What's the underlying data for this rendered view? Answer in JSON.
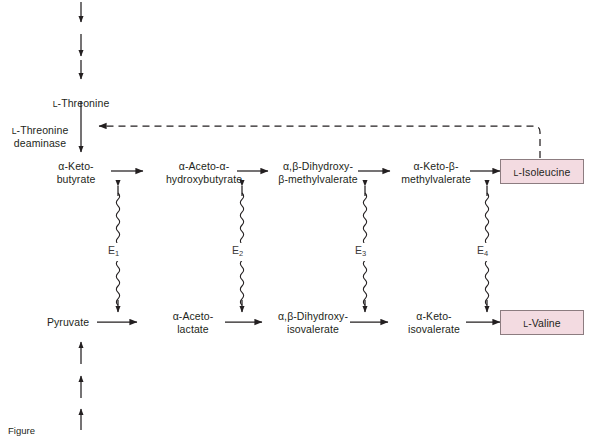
{
  "diagram": {
    "colors": {
      "product_box_fill": "#f3dbe1",
      "product_box_border": "#8c7c80",
      "text": "#231f20",
      "arrow": "#231f20"
    },
    "upstream_chain": {
      "arrow_count": 3,
      "terminal_label": "L-Threonine"
    },
    "enzyme_step": {
      "label": "L-Threonine\ndeaminase"
    },
    "top_row": [
      {
        "name": "alpha-ketobutyrate",
        "label": "α-Keto-\nbutyrate"
      },
      {
        "name": "alpha-aceto-alpha-hydroxybutyrate",
        "label": "α-Aceto-α-\nhydroxybutyrate"
      },
      {
        "name": "alpha-beta-dihydroxy-beta-methylvalerate",
        "label": "α,β-Dihydroxy-\nβ-methylvalerate"
      },
      {
        "name": "alpha-keto-beta-methylvalerate",
        "label": "α-Keto-β-\nmethylvalerate"
      }
    ],
    "top_product": {
      "name": "l-isoleucine",
      "label": "L-Isoleucine"
    },
    "bottom_row": [
      {
        "name": "pyruvate",
        "label": "Pyruvate"
      },
      {
        "name": "alpha-acetolactate",
        "label": "α-Aceto-\nlactate"
      },
      {
        "name": "alpha-beta-dihydroxyisovalerate",
        "label": "α,β-Dihydroxy-\nisovalerate"
      },
      {
        "name": "alpha-ketoisovalerate",
        "label": "α-Keto-\nisovalerate"
      }
    ],
    "bottom_product": {
      "name": "l-valine",
      "label": "L-Valine"
    },
    "downstream_chain": {
      "arrow_count": 3
    },
    "enzymes": [
      {
        "name": "enzyme-1",
        "label": "E",
        "subscript": "1"
      },
      {
        "name": "enzyme-2",
        "label": "E",
        "subscript": "2"
      },
      {
        "name": "enzyme-3",
        "label": "E",
        "subscript": "3"
      },
      {
        "name": "enzyme-4",
        "label": "E",
        "subscript": "4"
      }
    ],
    "feedback": {
      "name": "feedback-inhibition",
      "from": "L-Isoleucine",
      "to": "L-Threonine deaminase",
      "style": "dashed"
    },
    "caption": {
      "text": "Figure"
    }
  }
}
